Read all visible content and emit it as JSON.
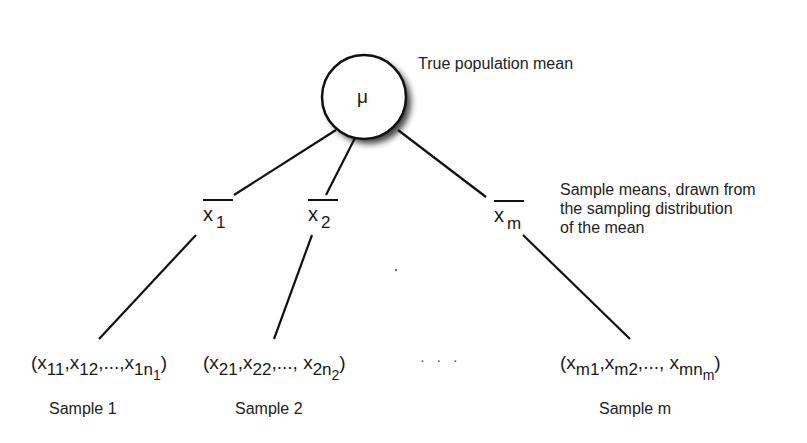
{
  "diagram": {
    "root": {
      "symbol": "μ",
      "caption": "True population mean"
    },
    "sample_means_caption": {
      "line1": "Sample means, drawn from",
      "line2": "the sampling distribution",
      "line3": "of the mean"
    },
    "means": [
      {
        "symbol": "x",
        "sub": "1"
      },
      {
        "symbol": "x",
        "sub": "2"
      },
      {
        "symbol": "x",
        "sub": "m"
      }
    ],
    "samples": [
      {
        "open": "(",
        "x1": "x",
        "s1": "11",
        "sep1": ",",
        "x2": "x",
        "s2": "12",
        "sep2": ",...,",
        "x3": "x",
        "s3": "1n",
        "s3sub": "1",
        "close": ")",
        "label": "Sample 1"
      },
      {
        "open": "(",
        "x1": "x",
        "s1": "21",
        "sep1": ",",
        "x2": "x",
        "s2": "22",
        "sep2": ",..., ",
        "x3": "x",
        "s3": "2n",
        "s3sub": "2",
        "close": ")",
        "label": "Sample 2"
      },
      {
        "open": "(",
        "x1": "x",
        "s1": "m1",
        "sep1": ",",
        "x2": "x",
        "s2": "m2",
        "sep2": ",..., ",
        "x3": "x",
        "s3": "mn",
        "s3sub": "m",
        "close": ")",
        "label": "Sample m"
      }
    ],
    "ellipsis": "· · ·",
    "colors": {
      "line": "#111111",
      "background": "#ffffff",
      "shadow": "#333333"
    }
  }
}
